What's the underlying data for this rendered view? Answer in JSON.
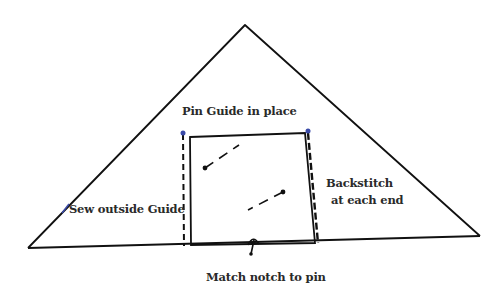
{
  "diagram": {
    "type": "sewing-instruction-sketch",
    "colors": {
      "line": "#111111",
      "text": "#2a2a2a",
      "pin_marker": "#3a4aa8",
      "background": "#ffffff"
    },
    "shapes": {
      "triangle": {
        "apex": [
          245,
          25
        ],
        "left": [
          28,
          248
        ],
        "right": [
          480,
          236
        ]
      },
      "guide_square": {
        "tl": [
          190,
          137
        ],
        "tr": [
          305,
          133
        ],
        "br": [
          315,
          243
        ],
        "bl": [
          191,
          245
        ]
      }
    },
    "labels": {
      "top": "Pin Guide in place",
      "left": "Sew outside Guide",
      "right_line1": "Backstitch",
      "right_line2": "at each end",
      "bottom": "Match notch to pin"
    }
  }
}
